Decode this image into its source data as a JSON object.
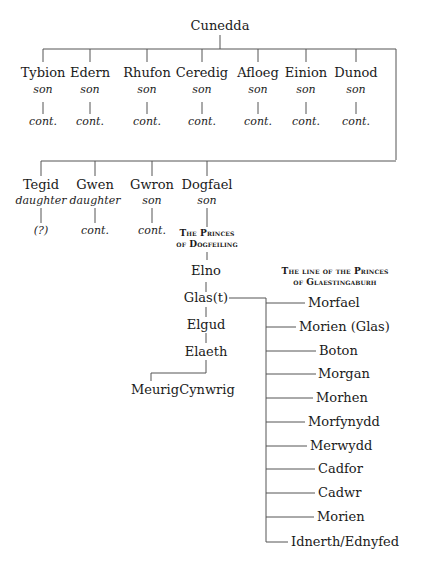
{
  "root": {
    "name": "Cunedda"
  },
  "row1": [
    {
      "name": "Tybion",
      "relation": "son",
      "descendants": "cont."
    },
    {
      "name": "Edern",
      "relation": "son",
      "descendants": "cont."
    },
    {
      "name": "Rhufon",
      "relation": "son",
      "descendants": "cont."
    },
    {
      "name": "Ceredig",
      "relation": "son",
      "descendants": "cont."
    },
    {
      "name": "Afloeg",
      "relation": "son",
      "descendants": "cont."
    },
    {
      "name": "Einion",
      "relation": "son",
      "descendants": "cont."
    },
    {
      "name": "Dunod",
      "relation": "son",
      "descendants": "cont."
    }
  ],
  "row2": [
    {
      "name": "Tegid",
      "relation": "daughter",
      "descendants": "(?)"
    },
    {
      "name": "Gwen",
      "relation": "daughter",
      "descendants": "cont."
    },
    {
      "name": "Gwron",
      "relation": "son",
      "descendants": "cont."
    },
    {
      "name": "Dogfael",
      "relation": "son"
    }
  ],
  "dogfeiling": {
    "heading_line1": "The Princes",
    "heading_line2": "of Dogfeiling",
    "lineage": [
      "Elno",
      "Glas(t)",
      "Elgud",
      "Elaeth"
    ],
    "elaeth_children": [
      "Meurig",
      "Cynwrig"
    ]
  },
  "glaestingaburh": {
    "heading_line1": "The line of the Princes",
    "heading_line2": "of Glaestingaburh",
    "line": [
      "Morfael",
      "Morien (Glas)",
      "Boton",
      "Morgan",
      "Morhen",
      "Morfynydd",
      "Merwydd",
      "Cadfor",
      "Cadwr",
      "Morien",
      "Idnerth/Ednyfed"
    ]
  }
}
